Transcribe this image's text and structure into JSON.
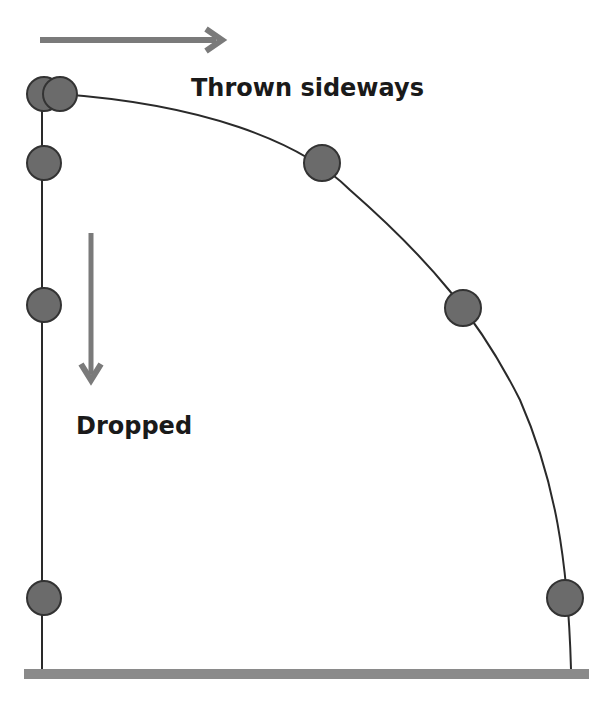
{
  "diagram": {
    "labels": {
      "thrown": "Thrown sideways",
      "dropped": "Dropped"
    },
    "colors": {
      "ball_fill": "#6b6b6b",
      "ball_stroke": "#333333",
      "arrow": "#7a7a7a",
      "ground": "#8a8a8a",
      "path": "#2a2a2a"
    },
    "dropped_balls": [
      {
        "x": 44,
        "y": 94
      },
      {
        "x": 44,
        "y": 163
      },
      {
        "x": 44,
        "y": 305
      },
      {
        "x": 44,
        "y": 598
      }
    ],
    "thrown_balls": [
      {
        "x": 60,
        "y": 94
      },
      {
        "x": 322,
        "y": 163
      },
      {
        "x": 463,
        "y": 308
      },
      {
        "x": 565,
        "y": 598
      }
    ]
  }
}
